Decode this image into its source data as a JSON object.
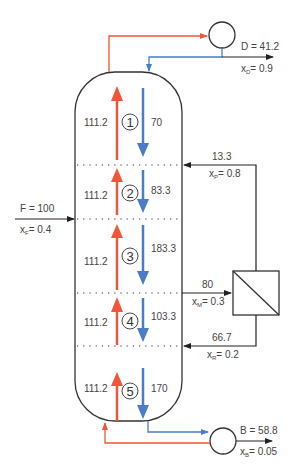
{
  "colors": {
    "vapor": "#f0563a",
    "liquid": "#4a7cc7",
    "line": "#333333",
    "text": "#444444"
  },
  "distillate": {
    "label": "D = 41.2",
    "comp_main": "x",
    "comp_sub": "D",
    "comp_val": "= 0.9"
  },
  "bottoms": {
    "label": "B = 58.8",
    "comp_main": "x",
    "comp_sub": "B",
    "comp_val": "= 0.05"
  },
  "feed": {
    "label": "F = 100",
    "comp_main": "x",
    "comp_sub": "F",
    "comp_val": "= 0.4"
  },
  "permeate": {
    "flow": "13.3",
    "comp_main": "x",
    "comp_sub": "P",
    "comp_val": "= 0.8"
  },
  "membrane_feed": {
    "flow": "80",
    "comp_main": "x",
    "comp_sub": "M",
    "comp_val": "= 0.3"
  },
  "retentate": {
    "flow": "66.7",
    "comp_main": "x",
    "comp_sub": "R",
    "comp_val": "= 0.2"
  },
  "stages": [
    {
      "num": "1",
      "vapor": "111.2",
      "liquid": "70"
    },
    {
      "num": "2",
      "vapor": "111.2",
      "liquid": "83.3"
    },
    {
      "num": "3",
      "vapor": "111.2",
      "liquid": "183.3"
    },
    {
      "num": "4",
      "vapor": "111.2",
      "liquid": "103.3"
    },
    {
      "num": "5",
      "vapor": "111.2",
      "liquid": "170"
    }
  ]
}
